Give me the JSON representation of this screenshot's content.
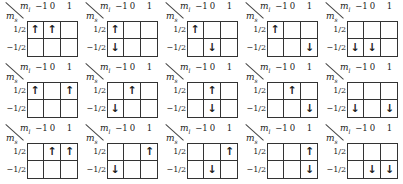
{
  "labels": {
    "ml": "m",
    "ml_sub": "l",
    "ms": "m",
    "ms_sub": "s",
    "col_headers": [
      "−1",
      "0",
      "1"
    ],
    "row_headers": [
      "1/2",
      "−1/2"
    ]
  },
  "symbols": {
    "up": "↑",
    "down": "↓",
    "empty": ""
  },
  "panels": [
    {
      "cells": [
        [
          "up",
          "up",
          ""
        ],
        [
          "",
          "",
          ""
        ]
      ]
    },
    {
      "cells": [
        [
          "up",
          "",
          ""
        ],
        [
          "down",
          "",
          ""
        ]
      ]
    },
    {
      "cells": [
        [
          "up",
          "",
          ""
        ],
        [
          "",
          "down",
          ""
        ]
      ]
    },
    {
      "cells": [
        [
          "up",
          "",
          ""
        ],
        [
          "",
          "",
          "down"
        ]
      ]
    },
    {
      "cells": [
        [
          "",
          "",
          ""
        ],
        [
          "down",
          "down",
          ""
        ]
      ]
    },
    {
      "cells": [
        [
          "up",
          "",
          "up"
        ],
        [
          "",
          "",
          ""
        ]
      ]
    },
    {
      "cells": [
        [
          "",
          "up",
          ""
        ],
        [
          "down",
          "",
          ""
        ]
      ]
    },
    {
      "cells": [
        [
          "",
          "up",
          ""
        ],
        [
          "",
          "down",
          ""
        ]
      ]
    },
    {
      "cells": [
        [
          "",
          "up",
          ""
        ],
        [
          "",
          "",
          "down"
        ]
      ]
    },
    {
      "cells": [
        [
          "",
          "",
          ""
        ],
        [
          "down",
          "",
          "down"
        ]
      ]
    },
    {
      "cells": [
        [
          "",
          "up",
          "up"
        ],
        [
          "",
          "",
          ""
        ]
      ]
    },
    {
      "cells": [
        [
          "",
          "",
          "up"
        ],
        [
          "down",
          "",
          ""
        ]
      ]
    },
    {
      "cells": [
        [
          "",
          "",
          "up"
        ],
        [
          "",
          "down",
          ""
        ]
      ]
    },
    {
      "cells": [
        [
          "",
          "",
          "up"
        ],
        [
          "",
          "",
          "down"
        ]
      ]
    },
    {
      "cells": [
        [
          "",
          "",
          ""
        ],
        [
          "",
          "down",
          "down"
        ]
      ]
    }
  ]
}
